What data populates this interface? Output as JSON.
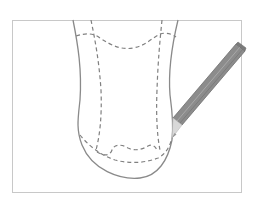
{
  "illustration": {
    "subject": "insole outline with dashed seam lines and pencil",
    "colors": {
      "background": "#ffffff",
      "frame": "#c8c8c8",
      "outline": "#8a8a8a",
      "dashed": "#808080",
      "pencil_body": "#8c8c8c",
      "pencil_edge": "#6e6e6e",
      "pencil_wood": "#d8d8d8",
      "pencil_lead": "#9a9a9a"
    },
    "icons": [
      "pencil-icon"
    ]
  }
}
